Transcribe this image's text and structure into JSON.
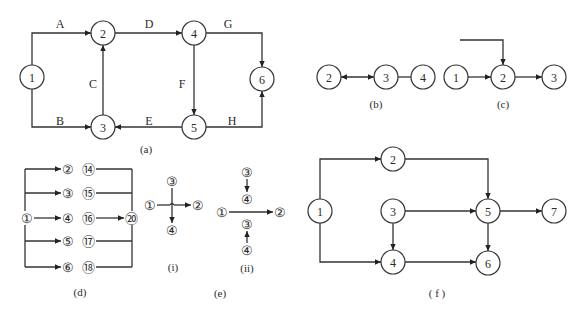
{
  "diagrams": {
    "a": {
      "caption": "(a)",
      "caption_pos": [
        146,
        149
      ],
      "radius": 12,
      "nodes": [
        {
          "id": "1",
          "label": "1",
          "x": 32,
          "y": 77
        },
        {
          "id": "2",
          "label": "2",
          "x": 103,
          "y": 33
        },
        {
          "id": "3",
          "label": "3",
          "x": 103,
          "y": 127
        },
        {
          "id": "4",
          "label": "4",
          "x": 194,
          "y": 33
        },
        {
          "id": "5",
          "label": "5",
          "x": 194,
          "y": 127
        },
        {
          "id": "6",
          "label": "6",
          "x": 262,
          "y": 79
        }
      ],
      "edges": [
        {
          "label": "A",
          "label_pos": [
            60,
            24
          ],
          "path": [
            [
              32,
              65
            ],
            [
              32,
              33
            ],
            [
              91,
              33
            ]
          ],
          "arrow": "end"
        },
        {
          "label": "B",
          "label_pos": [
            60,
            121
          ],
          "path": [
            [
              32,
              89
            ],
            [
              32,
              127
            ],
            [
              91,
              127
            ]
          ],
          "arrow": "end"
        },
        {
          "label": "C",
          "label_pos": [
            93,
            84
          ],
          "path": [
            [
              103,
              115
            ],
            [
              103,
              45
            ]
          ],
          "arrow": "end"
        },
        {
          "label": "D",
          "label_pos": [
            149,
            24
          ],
          "path": [
            [
              115,
              33
            ],
            [
              182,
              33
            ]
          ],
          "arrow": "end"
        },
        {
          "label": "E",
          "label_pos": [
            149,
            121
          ],
          "path": [
            [
              182,
              127
            ],
            [
              115,
              127
            ]
          ],
          "arrow": "end"
        },
        {
          "label": "F",
          "label_pos": [
            182,
            84
          ],
          "path": [
            [
              194,
              45
            ],
            [
              194,
              115
            ]
          ],
          "arrow": "end"
        },
        {
          "label": "G",
          "label_pos": [
            228,
            24
          ],
          "path": [
            [
              206,
              33
            ],
            [
              262,
              33
            ],
            [
              262,
              67
            ]
          ],
          "arrow": "end"
        },
        {
          "label": "H",
          "label_pos": [
            232,
            121
          ],
          "path": [
            [
              206,
              127
            ],
            [
              262,
              127
            ],
            [
              262,
              91
            ]
          ],
          "arrow": "end"
        }
      ]
    },
    "b": {
      "caption": "(b)",
      "caption_pos": [
        376,
        104
      ],
      "radius": 12,
      "nodes": [
        {
          "id": "2",
          "label": "2",
          "x": 329,
          "y": 77
        },
        {
          "id": "3",
          "label": "3",
          "x": 386,
          "y": 77
        },
        {
          "id": "4",
          "label": "4",
          "x": 423,
          "y": 77
        }
      ],
      "edges": [
        {
          "label": "",
          "path": [
            [
              341,
              77
            ],
            [
              374,
              77
            ]
          ],
          "arrow": "both"
        },
        {
          "label": "",
          "path": [
            [
              398,
              77
            ],
            [
              411,
              77
            ]
          ],
          "arrow": "none"
        }
      ]
    },
    "c": {
      "caption": "(c)",
      "caption_pos": [
        503,
        104
      ],
      "radius": 12,
      "nodes": [
        {
          "id": "1",
          "label": "1",
          "x": 456,
          "y": 77
        },
        {
          "id": "2",
          "label": "2",
          "x": 503,
          "y": 77
        },
        {
          "id": "3",
          "label": "3",
          "x": 554,
          "y": 77
        }
      ],
      "edges": [
        {
          "label": "",
          "path": [
            [
              460,
              40
            ],
            [
              503,
              40
            ],
            [
              503,
              65
            ]
          ],
          "arrow": "end"
        },
        {
          "label": "",
          "path": [
            [
              468,
              77
            ],
            [
              491,
              77
            ]
          ],
          "arrow": "end"
        },
        {
          "label": "",
          "path": [
            [
              515,
              77
            ],
            [
              542,
              77
            ]
          ],
          "arrow": "end"
        }
      ]
    },
    "d": {
      "caption": "(d)",
      "caption_pos": [
        80,
        292
      ],
      "left_bus": {
        "x": 25,
        "y1": 169,
        "y2": 267
      },
      "right_bus": {
        "x": 132,
        "y1": 169,
        "y2": 267
      },
      "source": {
        "label": "①",
        "x": 27,
        "y": 218
      },
      "sink": {
        "label": "⑳",
        "x": 131,
        "y": 218
      },
      "rows": [
        {
          "y": 169,
          "start": "②",
          "end": "⑭"
        },
        {
          "y": 193,
          "start": "③",
          "end": "⑮"
        },
        {
          "y": 218,
          "start": "④",
          "end": "⑯"
        },
        {
          "y": 241,
          "start": "⑤",
          "end": "⑰"
        },
        {
          "y": 267,
          "start": "⑥",
          "end": "⑱"
        }
      ],
      "start_x": 68,
      "end_x": 88
    },
    "e": {
      "caption": "(e)",
      "caption_pos": [
        220,
        293
      ],
      "sub_i": {
        "caption": "(i)",
        "caption_pos": [
          173,
          267
        ],
        "n1": {
          "label": "①",
          "x": 150,
          "y": 205
        },
        "n2": {
          "label": "②",
          "x": 198,
          "y": 205
        },
        "n3": {
          "label": "③",
          "x": 172,
          "y": 181
        },
        "n4": {
          "label": "④",
          "x": 172,
          "y": 230
        }
      },
      "sub_ii": {
        "caption": "(ii)",
        "caption_pos": [
          247,
          268
        ],
        "n1": {
          "label": "①",
          "x": 222,
          "y": 212
        },
        "n2": {
          "label": "②",
          "x": 280,
          "y": 212
        },
        "n3_top": {
          "label": "③",
          "x": 247,
          "y": 172
        },
        "n4_top": {
          "label": "④",
          "x": 247,
          "y": 199
        },
        "n3_bot": {
          "label": "③",
          "x": 247,
          "y": 224
        },
        "n4_bot": {
          "label": "④",
          "x": 247,
          "y": 250
        }
      }
    },
    "f": {
      "caption": "( f )",
      "caption_pos": [
        437,
        293
      ],
      "radius": 12,
      "nodes": [
        {
          "id": "1",
          "label": "1",
          "x": 320,
          "y": 211
        },
        {
          "id": "2",
          "label": "2",
          "x": 393,
          "y": 159
        },
        {
          "id": "3",
          "label": "3",
          "x": 393,
          "y": 211
        },
        {
          "id": "4",
          "label": "4",
          "x": 393,
          "y": 262
        },
        {
          "id": "5",
          "label": "5",
          "x": 488,
          "y": 211
        },
        {
          "id": "6",
          "label": "6",
          "x": 488,
          "y": 263
        },
        {
          "id": "7",
          "label": "7",
          "x": 554,
          "y": 211
        }
      ],
      "edges": [
        {
          "label": "",
          "path": [
            [
              320,
              199
            ],
            [
              320,
              159
            ],
            [
              381,
              159
            ]
          ],
          "arrow": "end"
        },
        {
          "label": "",
          "path": [
            [
              320,
              223
            ],
            [
              320,
              262
            ],
            [
              381,
              262
            ]
          ],
          "arrow": "end"
        },
        {
          "label": "",
          "path": [
            [
              405,
              159
            ],
            [
              488,
              159
            ],
            [
              488,
              199
            ]
          ],
          "arrow": "end"
        },
        {
          "label": "",
          "path": [
            [
              405,
              211
            ],
            [
              476,
              211
            ]
          ],
          "arrow": "end"
        },
        {
          "label": "",
          "path": [
            [
              393,
              223
            ],
            [
              393,
              250
            ]
          ],
          "arrow": "end"
        },
        {
          "label": "",
          "path": [
            [
              405,
              262
            ],
            [
              476,
              262
            ]
          ],
          "arrow": "end"
        },
        {
          "label": "",
          "path": [
            [
              500,
              211
            ],
            [
              542,
              211
            ]
          ],
          "arrow": "end"
        },
        {
          "label": "",
          "path": [
            [
              488,
              223
            ],
            [
              488,
              251
            ]
          ],
          "arrow": "end"
        }
      ]
    }
  }
}
